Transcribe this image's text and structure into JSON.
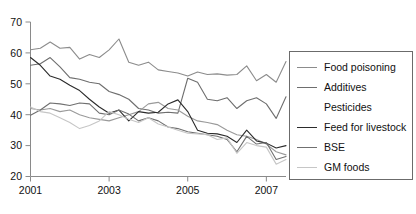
{
  "chart_data": {
    "type": "line",
    "title": "",
    "xlabel": "",
    "ylabel": "",
    "xlim": [
      2001,
      2007.5
    ],
    "ylim": [
      20,
      70
    ],
    "yticks": [
      20,
      30,
      40,
      50,
      60,
      70
    ],
    "ytick_labels": [
      "20",
      "30",
      "40",
      "50",
      "60",
      "70"
    ],
    "xticks": [
      2001,
      2003,
      2005,
      2007
    ],
    "xtick_labels": [
      "2001",
      "2003",
      "2005",
      "2007"
    ],
    "grid": false,
    "legend_position": "right",
    "x": [
      2001.0,
      2001.25,
      2001.5,
      2001.75,
      2002.0,
      2002.25,
      2002.5,
      2002.75,
      2003.0,
      2003.25,
      2003.5,
      2003.75,
      2004.0,
      2004.25,
      2004.5,
      2004.75,
      2005.0,
      2005.25,
      2005.5,
      2005.75,
      2006.0,
      2006.25,
      2006.5,
      2006.75,
      2007.0,
      2007.25,
      2007.5
    ],
    "series": [
      {
        "name": "Food poisoning",
        "color": "#8c8c8c",
        "values": [
          61.0,
          61.5,
          63.5,
          61.5,
          61.8,
          58.0,
          59.5,
          58.5,
          61.0,
          64.5,
          57.0,
          56.0,
          57.0,
          54.5,
          54.0,
          53.5,
          52.5,
          53.8,
          53.0,
          53.2,
          52.8,
          53.0,
          55.8,
          51.0,
          53.0,
          50.5,
          57.2
        ]
      },
      {
        "name": "Additives",
        "color": "#6e6e6e",
        "values": [
          56.0,
          56.5,
          58.5,
          55.5,
          52.0,
          51.5,
          50.5,
          50.0,
          47.5,
          46.5,
          45.0,
          42.0,
          41.5,
          40.5,
          40.8,
          40.5,
          51.8,
          50.5,
          45.0,
          44.5,
          45.5,
          42.0,
          44.5,
          45.5,
          43.5,
          38.8,
          45.8
        ]
      },
      {
        "name": "Pesticides",
        "color": "#9a9a9a",
        "values": [
          42.0,
          41.5,
          42.0,
          41.0,
          41.5,
          40.0,
          39.0,
          38.5,
          38.0,
          39.0,
          40.0,
          41.0,
          43.5,
          44.0,
          42.0,
          41.5,
          39.5,
          38.0,
          37.5,
          36.8,
          35.0,
          33.5,
          33.0,
          32.0,
          30.5,
          28.0,
          27.0
        ]
      },
      {
        "name": "Feed for livestock",
        "color": "#2b2b2b",
        "values": [
          58.5,
          56.0,
          52.5,
          51.5,
          49.5,
          47.8,
          45.0,
          42.5,
          40.5,
          41.5,
          38.0,
          41.0,
          40.5,
          40.8,
          43.5,
          44.8,
          41.0,
          35.0,
          34.0,
          33.8,
          33.0,
          31.0,
          35.0,
          31.5,
          30.8,
          29.2,
          30.0
        ]
      },
      {
        "name": "BSE",
        "color": "#707070",
        "values": [
          39.8,
          41.5,
          43.8,
          43.5,
          43.0,
          43.8,
          43.5,
          40.5,
          40.0,
          41.5,
          40.2,
          38.0,
          39.0,
          38.0,
          36.0,
          35.5,
          34.5,
          34.0,
          33.5,
          33.0,
          32.0,
          28.0,
          33.0,
          30.5,
          31.0,
          25.5,
          26.5
        ]
      },
      {
        "name": "GM foods",
        "color": "#c6c6c6",
        "values": [
          42.5,
          41.0,
          40.5,
          39.0,
          37.5,
          35.5,
          36.5,
          38.0,
          41.0,
          40.0,
          38.5,
          37.5,
          39.0,
          37.0,
          36.0,
          35.0,
          34.0,
          33.8,
          33.5,
          32.0,
          32.5,
          27.5,
          31.0,
          30.0,
          29.5,
          24.0,
          25.5
        ]
      }
    ]
  },
  "legend": {
    "items": [
      {
        "label": "Food poisoning",
        "color": "#8c8c8c",
        "show_swatch": true
      },
      {
        "label": "Additives",
        "color": "#6e6e6e",
        "show_swatch": true
      },
      {
        "label": "Pesticides",
        "color": "#ffffff",
        "show_swatch": false
      },
      {
        "label": "Feed for livestock",
        "color": "#2b2b2b",
        "show_swatch": true
      },
      {
        "label": "BSE",
        "color": "#707070",
        "show_swatch": true
      },
      {
        "label": "GM foods",
        "color": "#c6c6c6",
        "show_swatch": true
      }
    ]
  },
  "axis": {
    "line_color": "#8a8a8a"
  }
}
